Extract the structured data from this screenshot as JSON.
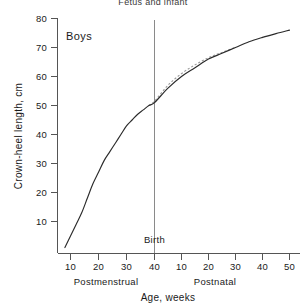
{
  "figure": {
    "title": "Fetus and infant",
    "series_label": "Boys",
    "birth_label": "Birth"
  },
  "axes": {
    "y_title": "Crown-heel length, cm",
    "x_title": "Age, weeks",
    "x_scale_left_title": "Postmenstrual",
    "x_scale_right_title": "Postnatal",
    "y_ticks": [
      10,
      20,
      30,
      40,
      50,
      60,
      70,
      80
    ],
    "x_ticks_postmenstrual": [
      10,
      20,
      30,
      40
    ],
    "x_ticks_postnatal": [
      10,
      20,
      30,
      40,
      50
    ]
  },
  "colors": {
    "curve_main": "#2b2b2b",
    "curve_alt": "#9a9a9a",
    "axis": "#555555",
    "birth_line": "#8a8a8a",
    "background": "#ffffff"
  },
  "chart_data": {
    "type": "line",
    "title": "Fetus and infant",
    "xlabel": "Age, weeks",
    "ylabel": "Crown-heel length, cm",
    "ylim": [
      0,
      80
    ],
    "grid": false,
    "legend": "none",
    "annotations": [
      {
        "text": "Boys",
        "x_week": 16,
        "y_cm": 75
      },
      {
        "text": "Birth",
        "x_week": 40,
        "y_cm": 3
      }
    ],
    "x_axis_note": "Dual scale: postmenstrual weeks 0-40 to the left of birth, postnatal weeks 0-50 to the right of birth",
    "series": [
      {
        "name": "Crown-heel length (observed)",
        "style": "solid",
        "points": [
          {
            "age_label": "8 postmenstrual",
            "x_week": 8,
            "y_cm": 1
          },
          {
            "age_label": "10 postmenstrual",
            "x_week": 10,
            "y_cm": 5
          },
          {
            "age_label": "12 postmenstrual",
            "x_week": 12,
            "y_cm": 9
          },
          {
            "age_label": "14 postmenstrual",
            "x_week": 14,
            "y_cm": 13
          },
          {
            "age_label": "16 postmenstrual",
            "x_week": 16,
            "y_cm": 18
          },
          {
            "age_label": "18 postmenstrual",
            "x_week": 18,
            "y_cm": 23
          },
          {
            "age_label": "20 postmenstrual",
            "x_week": 20,
            "y_cm": 27
          },
          {
            "age_label": "22 postmenstrual",
            "x_week": 22,
            "y_cm": 31
          },
          {
            "age_label": "24 postmenstrual",
            "x_week": 24,
            "y_cm": 34
          },
          {
            "age_label": "26 postmenstrual",
            "x_week": 26,
            "y_cm": 37
          },
          {
            "age_label": "28 postmenstrual",
            "x_week": 28,
            "y_cm": 40
          },
          {
            "age_label": "30 postmenstrual",
            "x_week": 30,
            "y_cm": 43
          },
          {
            "age_label": "32 postmenstrual",
            "x_week": 32,
            "y_cm": 45
          },
          {
            "age_label": "34 postmenstrual",
            "x_week": 34,
            "y_cm": 47
          },
          {
            "age_label": "36 postmenstrual",
            "x_week": 36,
            "y_cm": 48.5
          },
          {
            "age_label": "38 postmenstrual",
            "x_week": 38,
            "y_cm": 50
          },
          {
            "age_label": "40 postmenstrual (birth)",
            "x_week": 40,
            "y_cm": 51
          },
          {
            "age_label": "5 postnatal",
            "x_week": 45,
            "y_cm": 56
          },
          {
            "age_label": "10 postnatal",
            "x_week": 50,
            "y_cm": 60
          },
          {
            "age_label": "15 postnatal",
            "x_week": 55,
            "y_cm": 63
          },
          {
            "age_label": "20 postnatal",
            "x_week": 60,
            "y_cm": 66
          },
          {
            "age_label": "25 postnatal",
            "x_week": 65,
            "y_cm": 68
          },
          {
            "age_label": "30 postnatal",
            "x_week": 70,
            "y_cm": 70
          },
          {
            "age_label": "35 postnatal",
            "x_week": 75,
            "y_cm": 72
          },
          {
            "age_label": "40 postnatal",
            "x_week": 80,
            "y_cm": 73.5
          },
          {
            "age_label": "45 postnatal",
            "x_week": 85,
            "y_cm": 74.8
          },
          {
            "age_label": "50 postnatal",
            "x_week": 90,
            "y_cm": 76
          }
        ]
      },
      {
        "name": "Extrapolated intrauterine trend",
        "style": "dashed",
        "points": [
          {
            "age_label": "38 postmenstrual",
            "x_week": 38,
            "y_cm": 50
          },
          {
            "age_label": "40 postmenstrual (birth)",
            "x_week": 40,
            "y_cm": 51.5
          },
          {
            "age_label": "5 postnatal",
            "x_week": 45,
            "y_cm": 57
          },
          {
            "age_label": "10 postnatal",
            "x_week": 50,
            "y_cm": 61
          },
          {
            "age_label": "15 postnatal",
            "x_week": 55,
            "y_cm": 64
          },
          {
            "age_label": "20 postnatal",
            "x_week": 60,
            "y_cm": 66.5
          },
          {
            "age_label": "25 postnatal",
            "x_week": 65,
            "y_cm": 68.3
          },
          {
            "age_label": "30 postnatal",
            "x_week": 70,
            "y_cm": 70.1
          }
        ]
      }
    ]
  }
}
